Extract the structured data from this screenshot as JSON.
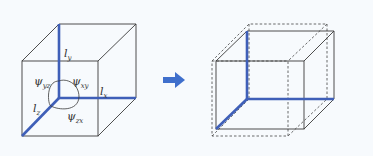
{
  "diagram": {
    "colors": {
      "background": "#f7fafd",
      "edge": "#3a3a3a",
      "highlight": "#3f5fb8",
      "arrow": "#3f6fcc",
      "dashed": "#444444"
    },
    "left_cube": {
      "labels": {
        "ly": {
          "base": "l",
          "sub": "y"
        },
        "lx": {
          "base": "l",
          "sub": "x"
        },
        "lz": {
          "base": "l",
          "sub": "z"
        },
        "psi_yz": {
          "base": "ψ",
          "sub": "yz"
        },
        "psi_xy": {
          "base": "ψ",
          "sub": "xy"
        },
        "psi_zx": {
          "base": "ψ",
          "sub": "zx"
        }
      }
    },
    "arrow": {
      "direction": "right"
    },
    "right_cube": {
      "solid": "deformed box",
      "dashed": "original cube outline"
    }
  }
}
